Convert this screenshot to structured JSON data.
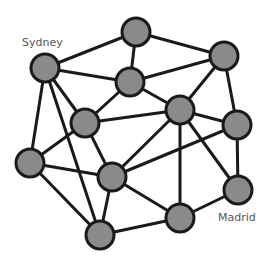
{
  "diagram": {
    "type": "network-graph",
    "node_radius": 14,
    "colors": {
      "node_fill": "#8a8a8a",
      "node_stroke": "#1a1a1a",
      "edge": "#1a1a1a",
      "label": "#555555"
    },
    "nodes": [
      {
        "id": "n1",
        "x": 136,
        "y": 32,
        "label": ""
      },
      {
        "id": "sydney",
        "x": 45,
        "y": 68,
        "label": "Sydney"
      },
      {
        "id": "n3",
        "x": 224,
        "y": 56,
        "label": ""
      },
      {
        "id": "n4",
        "x": 130,
        "y": 82,
        "label": ""
      },
      {
        "id": "n5",
        "x": 180,
        "y": 110,
        "label": ""
      },
      {
        "id": "n6",
        "x": 237,
        "y": 125,
        "label": ""
      },
      {
        "id": "n7",
        "x": 85,
        "y": 123,
        "label": ""
      },
      {
        "id": "n8",
        "x": 30,
        "y": 163,
        "label": ""
      },
      {
        "id": "n9",
        "x": 112,
        "y": 177,
        "label": ""
      },
      {
        "id": "madrid",
        "x": 238,
        "y": 190,
        "label": "Madrid"
      },
      {
        "id": "n11",
        "x": 180,
        "y": 218,
        "label": ""
      },
      {
        "id": "n12",
        "x": 100,
        "y": 235,
        "label": ""
      }
    ],
    "edges": [
      [
        "sydney",
        "n1"
      ],
      [
        "sydney",
        "n4"
      ],
      [
        "sydney",
        "n7"
      ],
      [
        "sydney",
        "n8"
      ],
      [
        "sydney",
        "n12"
      ],
      [
        "n1",
        "n4"
      ],
      [
        "n1",
        "n3"
      ],
      [
        "n4",
        "n3"
      ],
      [
        "n4",
        "n5"
      ],
      [
        "n4",
        "n7"
      ],
      [
        "n3",
        "n5"
      ],
      [
        "n3",
        "n6"
      ],
      [
        "n7",
        "n5"
      ],
      [
        "n7",
        "n8"
      ],
      [
        "n7",
        "n9"
      ],
      [
        "n5",
        "n6"
      ],
      [
        "n5",
        "n9"
      ],
      [
        "n5",
        "n11"
      ],
      [
        "n5",
        "madrid"
      ],
      [
        "n6",
        "n9"
      ],
      [
        "n6",
        "madrid"
      ],
      [
        "n8",
        "n9"
      ],
      [
        "n8",
        "n12"
      ],
      [
        "n9",
        "n12"
      ],
      [
        "n9",
        "n11"
      ],
      [
        "madrid",
        "n11"
      ],
      [
        "n11",
        "n12"
      ]
    ],
    "labels": [
      {
        "node": "sydney",
        "text": "Sydney",
        "x": 22,
        "y": 46
      },
      {
        "node": "madrid",
        "text": "Madrid",
        "x": 218,
        "y": 221
      }
    ]
  }
}
